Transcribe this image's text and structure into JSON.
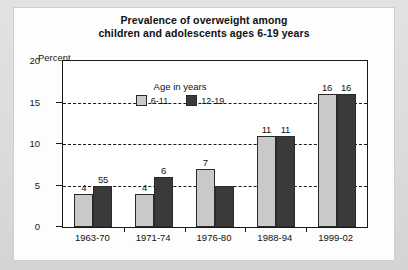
{
  "chart_data": {
    "type": "bar",
    "title": "Prevalence of overweight among children and adolescents ages 6-19 years",
    "title_line1": "Prevalence of overweight among",
    "title_line2": "children and adolescents ages 6-19 years",
    "xlabel": "",
    "ylabel": "Percent",
    "ylim": [
      0,
      20
    ],
    "yticks": [
      0,
      5,
      10,
      15,
      20
    ],
    "gridlines": [
      5,
      10,
      15
    ],
    "grid": true,
    "grid_style": "dashed",
    "legend_position": "inside-upper-left",
    "legend_title": "Age in years",
    "categories": [
      "1963-70",
      "1971-74",
      "1976-80",
      "1988-94",
      "1999-02"
    ],
    "series": [
      {
        "name": "6-11",
        "color": "#c9c9c9",
        "values": [
          4,
          4,
          7,
          11,
          16
        ],
        "labels": [
          "4",
          "4",
          "7",
          "11",
          "16"
        ]
      },
      {
        "name": "12-19",
        "color": "#3a3a3a",
        "values": [
          5,
          6,
          5,
          11,
          16
        ],
        "labels": [
          "55",
          "6",
          "",
          "11",
          "16"
        ]
      }
    ]
  },
  "colors": {
    "series_light": "#c9c9c9",
    "series_dark": "#3a3a3a",
    "axis": "#1a1a1a",
    "plot_background": "#ffffff",
    "card_background": "#fdfdfd",
    "page_background": "#dcdcdc"
  }
}
